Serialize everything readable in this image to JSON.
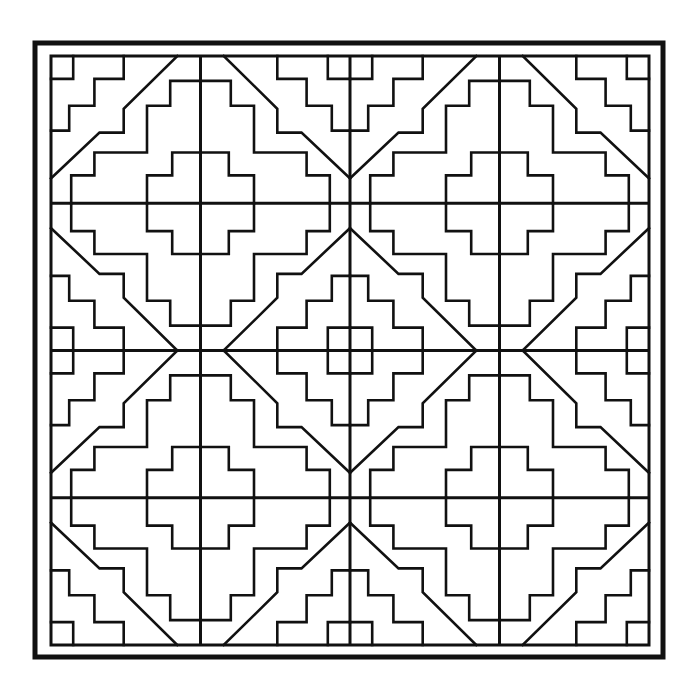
{
  "image": {
    "title": "Stepped diamond geometric pattern",
    "description": "Black-and-white line art: a square framed field of four stepped-diamond tiles arranged 2x2, forming a central diamond where they meet",
    "colors": {
      "line": "#111111",
      "background": "#ffffff"
    },
    "tiles": {
      "rows": 2,
      "columns": 2,
      "symmetry": "four-fold mirror per tile"
    }
  }
}
